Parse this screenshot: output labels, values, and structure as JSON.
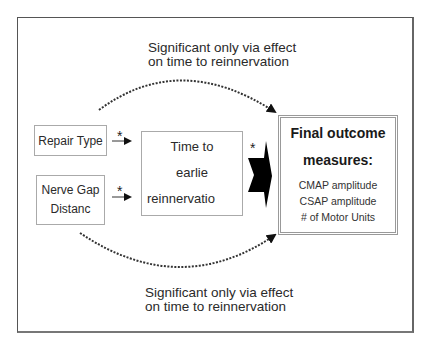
{
  "diagram": {
    "top_note": [
      "Significant only via effect",
      "on time to reinnervation"
    ],
    "bottom_note": [
      "Significant only via effect",
      "on time to reinnervation"
    ],
    "inputs": [
      {
        "label_lines": [
          "Repair Type"
        ]
      },
      {
        "label_lines": [
          "Nerve Gap",
          "Distanc"
        ]
      }
    ],
    "mediator": {
      "label_lines": [
        "Time to",
        "earlie",
        "reinnervatio"
      ]
    },
    "outcome": {
      "title_lines": [
        "Final outcome",
        "measures:"
      ],
      "measures": [
        "CMAP amplitude",
        "CSAP amplitude",
        "# of Motor Units"
      ]
    },
    "significance_marker": "*",
    "edges": [
      {
        "from": "Repair Type",
        "to": "Time to earlie reinnervatio",
        "style": "solid",
        "marker": "*"
      },
      {
        "from": "Nerve Gap Distanc",
        "to": "Time to earlie reinnervatio",
        "style": "solid",
        "marker": "*"
      },
      {
        "from": "Time to earlie reinnervatio",
        "to": "Final outcome measures",
        "style": "block-arrow",
        "marker": "*"
      },
      {
        "from": "Repair Type",
        "to": "Final outcome measures",
        "style": "dotted-curve",
        "note": "top_note"
      },
      {
        "from": "Nerve Gap Distanc",
        "to": "Final outcome measures",
        "style": "dotted-curve",
        "note": "bottom_note"
      }
    ]
  }
}
